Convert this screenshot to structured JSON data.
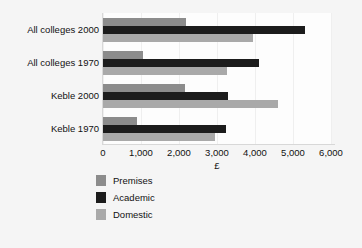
{
  "chart_data": {
    "type": "bar",
    "orientation": "horizontal",
    "title": "",
    "xlabel": "£",
    "ylabel": "",
    "xlim": [
      0,
      6000
    ],
    "xticks": [
      "0",
      "1,000",
      "2,000",
      "3,000",
      "4,000",
      "5,000",
      "6,000"
    ],
    "xtick_values": [
      0,
      1000,
      2000,
      3000,
      4000,
      5000,
      6000
    ],
    "grid": true,
    "grid_axis": "x",
    "legend_position": "bottom-left",
    "categories": [
      "All colleges 2000",
      "All colleges 1970",
      "Keble 2000",
      "Keble 1970"
    ],
    "series": [
      {
        "name": "Premises",
        "color": "#8c8c8c",
        "values": [
          2180,
          1050,
          2150,
          900
        ]
      },
      {
        "name": "Academic",
        "color": "#1c1c1c",
        "values": [
          5320,
          4100,
          3300,
          3230
        ]
      },
      {
        "name": "Domestic",
        "color": "#a9a9a9",
        "values": [
          3950,
          3250,
          4600,
          2950
        ]
      }
    ]
  },
  "colors": {
    "background": "#f5f5f5",
    "plot_background": "#fdfdfd",
    "gridline": "#efefef",
    "axis": "#d8d8d8",
    "text": "#111111"
  }
}
